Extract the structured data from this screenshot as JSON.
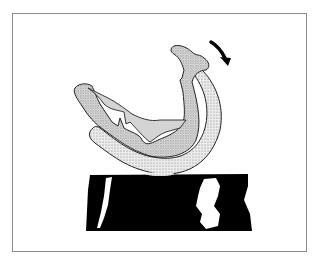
{
  "figure": {
    "colors": {
      "frame": "#8a8a8a",
      "stipple_light": "#e6e6e6",
      "stipple_dark": "#cfcfcf",
      "inner_gray": "#d4d4d4",
      "block": "#000000",
      "highlight": "#ffffff",
      "outline": "#222222"
    },
    "arrow": {
      "icon": "rotation-arrow-icon",
      "direction": "clockwise"
    }
  }
}
